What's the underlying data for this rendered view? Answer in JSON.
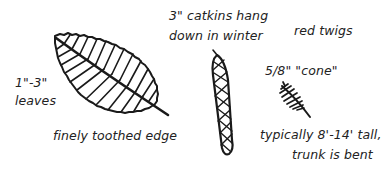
{
  "diagram": {
    "colors": {
      "ink": "#1a1a1a",
      "background": "#ffffff"
    },
    "labels": {
      "leaf_size_line1": "1\"-3\"",
      "leaf_size_line2": "leaves",
      "leaf_edge": "finely toothed edge",
      "catkins_line1": "3\" catkins hang",
      "catkins_line2": "down in winter",
      "twigs": "red twigs",
      "cone": "5/8\"  \"cone\"",
      "height_line1": "typically 8'-14' tall,",
      "height_line2": "trunk is bent"
    },
    "illustrations": [
      {
        "name": "leaf",
        "description": "oval leaf with finely toothed edge, midrib and parallel veins"
      },
      {
        "name": "catkin",
        "description": "long slender catkin with crosshatch pattern hanging down"
      },
      {
        "name": "cone",
        "description": "small hatched cone with stem"
      }
    ]
  }
}
